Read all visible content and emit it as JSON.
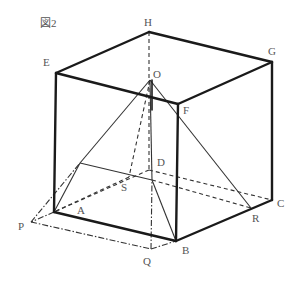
{
  "figure": {
    "title": "図2"
  },
  "labels": {
    "E": "E",
    "H": "H",
    "G": "G",
    "F": "F",
    "O": "O",
    "D": "D",
    "S": "S",
    "A": "A",
    "P": "P",
    "Q": "Q",
    "B": "B",
    "R": "R",
    "C": "C"
  },
  "colors": {
    "line": "#1a1a1a",
    "label": "#555555",
    "background": "#ffffff"
  }
}
